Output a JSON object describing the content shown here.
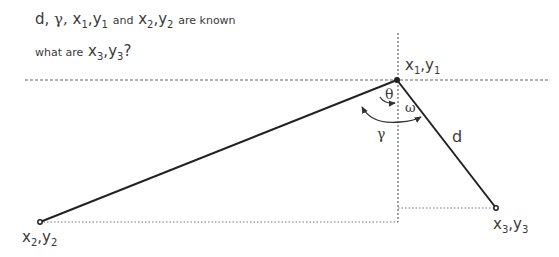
{
  "problem": {
    "line1": {
      "d": "d,",
      "gamma": "γ,",
      "x1": "x",
      "x1_sub": "1",
      "comma1": ",",
      "y1": "y",
      "y1_sub": "1",
      "and": "and",
      "x2": "x",
      "x2_sub": "2",
      "comma2": ",",
      "y2": "y",
      "y2_sub": "2",
      "known": "are known"
    },
    "line2": {
      "what": "what are",
      "x3": "x",
      "x3_sub": "3",
      "comma3": ",",
      "y3": "y",
      "y3_sub": "3",
      "q": "?"
    }
  },
  "labels": {
    "p1": {
      "x": "x",
      "xs": "1",
      "c": ",",
      "y": "y",
      "ys": "1"
    },
    "p2": {
      "x": "x",
      "xs": "2",
      "c": ",",
      "y": "y",
      "ys": "2"
    },
    "p3": {
      "x": "x",
      "xs": "3",
      "c": ",",
      "y": "y",
      "ys": "3"
    },
    "theta": "θ",
    "omega": "ω",
    "gamma": "γ",
    "d": "d"
  },
  "geometry": {
    "p1": [
      397,
      80
    ],
    "p2": [
      40,
      222
    ],
    "p3": [
      496,
      208
    ]
  }
}
